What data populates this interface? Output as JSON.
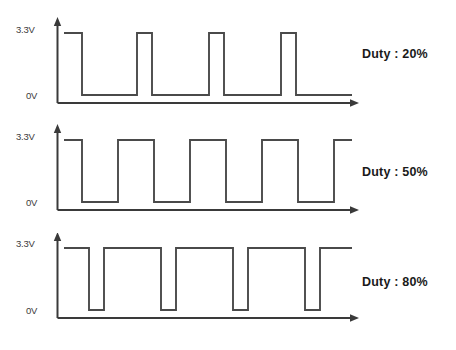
{
  "figure": {
    "line_color": "#4a4a4a",
    "axis_color": "#3a3a3a",
    "background": "#ffffff"
  },
  "axis": {
    "high_label": "3.3V",
    "low_label": "0V"
  },
  "panels": [
    {
      "id": "duty-20",
      "duty_label": "Duty : 20%",
      "duty_percent": 20,
      "high_label": "3.3V",
      "low_label": "0V"
    },
    {
      "id": "duty-50",
      "duty_label": "Duty : 50%",
      "duty_percent": 50,
      "high_label": "3.3V",
      "low_label": "0V"
    },
    {
      "id": "duty-80",
      "duty_label": "Duty : 80%",
      "duty_percent": 80,
      "high_label": "3.3V",
      "low_label": "0V"
    }
  ],
  "chart_data": {
    "type": "line",
    "xlabel": "",
    "ylabel": "Voltage",
    "grid": false,
    "legend": "right",
    "ylim": [
      0,
      3.3
    ],
    "ytick_labels": [
      "0V",
      "3.3V"
    ],
    "ytick_values": [
      0,
      3.3
    ],
    "series": [
      {
        "name": "Duty : 20%",
        "duty_percent": 20,
        "period_px": 72,
        "annotation": "Duty : 20%",
        "points": [
          [
            64,
            3.3
          ],
          [
            82,
            3.3
          ],
          [
            82,
            0
          ],
          [
            137,
            0
          ],
          [
            137,
            3.3
          ],
          [
            152,
            3.3
          ],
          [
            152,
            0
          ],
          [
            209,
            0
          ],
          [
            209,
            3.3
          ],
          [
            224,
            3.3
          ],
          [
            224,
            0
          ],
          [
            281,
            0
          ],
          [
            281,
            3.3
          ],
          [
            296,
            3.3
          ],
          [
            296,
            0
          ],
          [
            352,
            0
          ]
        ]
      },
      {
        "name": "Duty : 50%",
        "duty_percent": 50,
        "period_px": 72,
        "annotation": "Duty : 50%",
        "points": [
          [
            64,
            3.3
          ],
          [
            82,
            3.3
          ],
          [
            82,
            0
          ],
          [
            118,
            0
          ],
          [
            118,
            3.3
          ],
          [
            154,
            3.3
          ],
          [
            154,
            0
          ],
          [
            190,
            0
          ],
          [
            190,
            3.3
          ],
          [
            226,
            3.3
          ],
          [
            226,
            0
          ],
          [
            262,
            0
          ],
          [
            262,
            3.3
          ],
          [
            298,
            3.3
          ],
          [
            298,
            0
          ],
          [
            334,
            0
          ],
          [
            334,
            3.3
          ],
          [
            352,
            3.3
          ]
        ]
      },
      {
        "name": "Duty : 80%",
        "duty_percent": 80,
        "period_px": 72,
        "annotation": "Duty : 80%",
        "points": [
          [
            64,
            3.3
          ],
          [
            89,
            3.3
          ],
          [
            89,
            0
          ],
          [
            104,
            0
          ],
          [
            104,
            3.3
          ],
          [
            161,
            3.3
          ],
          [
            161,
            0
          ],
          [
            176,
            0
          ],
          [
            176,
            3.3
          ],
          [
            233,
            3.3
          ],
          [
            233,
            0
          ],
          [
            248,
            0
          ],
          [
            248,
            3.3
          ],
          [
            305,
            3.3
          ],
          [
            305,
            0
          ],
          [
            320,
            0
          ],
          [
            320,
            3.3
          ],
          [
            352,
            3.3
          ]
        ]
      }
    ]
  }
}
